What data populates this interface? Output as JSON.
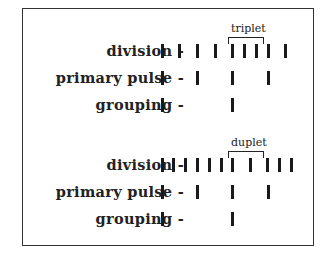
{
  "diagram": {
    "sections": [
      {
        "bracket_label": "triplet",
        "bracket": {
          "x1": 228,
          "x2": 262,
          "y": 37
        },
        "rows": [
          {
            "label": "division -",
            "y": 51,
            "ticks": [
              162,
              179,
              197,
              215,
              232,
              244,
              256,
              268,
              285
            ]
          },
          {
            "label": "primary pulse -",
            "y": 78,
            "ticks": [
              162,
              197,
              232,
              268
            ]
          },
          {
            "label": "grouping -",
            "y": 105,
            "ticks": [
              162,
              232
            ]
          }
        ]
      },
      {
        "bracket_label": "duplet",
        "bracket": {
          "x1": 228,
          "x2": 262,
          "y": 151
        },
        "rows": [
          {
            "label": "division -",
            "y": 165,
            "ticks": [
              162,
              173,
              185,
              197,
              209,
              221,
              232,
              250,
              267,
              279,
              291
            ]
          },
          {
            "label": "primary pulse -",
            "y": 192,
            "ticks": [
              162,
              197,
              232,
              268
            ]
          },
          {
            "label": "grouping -",
            "y": 219,
            "ticks": [
              162,
              232
            ]
          }
        ]
      }
    ]
  }
}
